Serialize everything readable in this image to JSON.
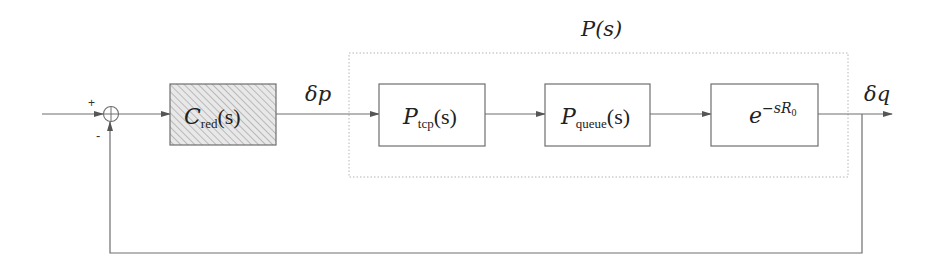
{
  "diagram": {
    "title": "P(s)",
    "colors": {
      "line": "#6e6e6e",
      "box_border": "#6e6e6e",
      "dotted_border": "#b0b0b0",
      "hatch_fill": "#e6e6e6",
      "hatch_line": "#9a9a9a",
      "text": "#222222"
    },
    "summing_junction": {
      "plus_sign": "+",
      "minus_sign": "-"
    },
    "blocks": [
      {
        "id": "c-red",
        "symbol": "C",
        "subscript": "red",
        "arg": "(s)",
        "hatched": true
      },
      {
        "id": "p-tcp",
        "symbol": "P",
        "subscript": "tcp",
        "arg": "(s)",
        "hatched": false
      },
      {
        "id": "p-queue",
        "symbol": "P",
        "subscript": "queue",
        "arg": "(s)",
        "hatched": false
      },
      {
        "id": "delay",
        "base": "e",
        "exponent": "−sR",
        "exponent_sub": "0",
        "hatched": false
      }
    ],
    "signals": {
      "controller_output": "δp",
      "plant_output": "δq"
    },
    "plant_group_label": "P(s)"
  }
}
